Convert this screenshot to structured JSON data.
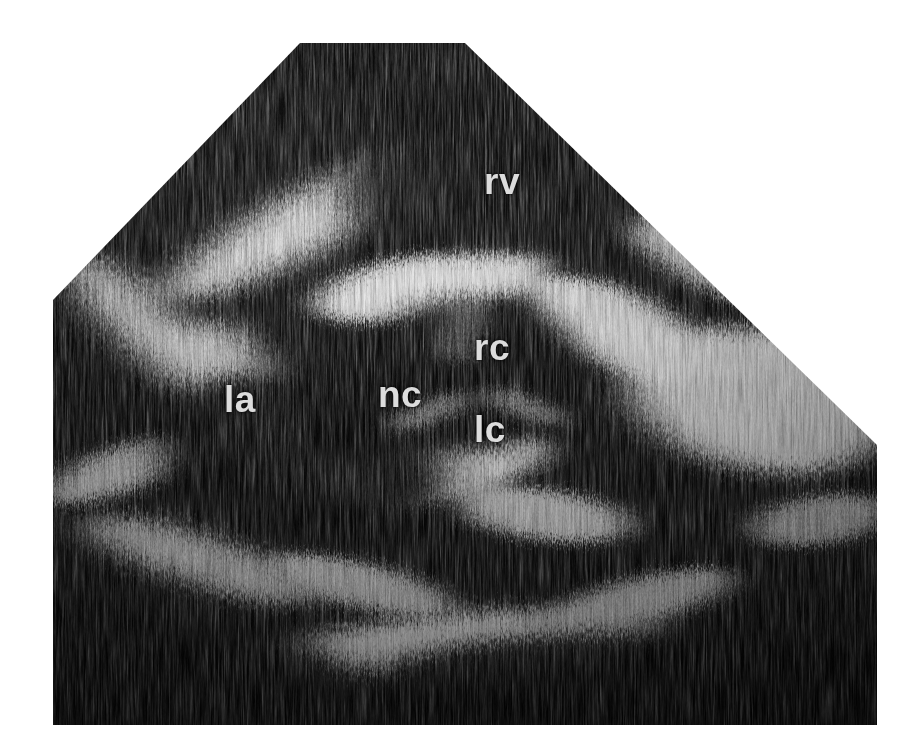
{
  "image": {
    "modality": "echocardiogram",
    "view": "parasternal short-axis at aortic valve level",
    "background_color": "#ffffff",
    "tissue_dark_color": "#0c0c0c",
    "tissue_bright_color": "#f2f2f2",
    "label_color": "#dcdcdc",
    "width": 913,
    "height": 749
  },
  "sector": {
    "shape": "truncated-sector",
    "vertices": "300,43 465,43 877,445 877,725 53,725 53,300",
    "apex_top_left_x": 300,
    "apex_top_right_x": 465,
    "apex_y": 43,
    "left_edge_x": 53,
    "right_edge_x": 877,
    "bottom_y": 725,
    "left_vertex_y": 300,
    "right_vertex_y": 445
  },
  "labels": [
    {
      "id": "rv",
      "text": "rv",
      "meaning": "right ventricle",
      "x": 484,
      "y": 163
    },
    {
      "id": "rc",
      "text": "rc",
      "meaning": "right coronary cusp",
      "x": 474,
      "y": 329
    },
    {
      "id": "nc",
      "text": "nc",
      "meaning": "non-coronary cusp",
      "x": 378,
      "y": 376
    },
    {
      "id": "lc",
      "text": "lc",
      "meaning": "left coronary cusp",
      "x": 474,
      "y": 411
    },
    {
      "id": "la",
      "text": "la",
      "meaning": "left atrium",
      "x": 224,
      "y": 381
    }
  ],
  "chart_data": {
    "type": "heatmap",
    "title": "",
    "xlabel": "",
    "ylabel": "",
    "bright_structures": [
      {
        "name": "anterior-rv-free-wall-band",
        "cx": 300,
        "cy": 225,
        "rx": 150,
        "ry": 30,
        "rot": -28,
        "intensity": 0.92
      },
      {
        "name": "aortic-root-anterior-wall",
        "cx": 430,
        "cy": 285,
        "rx": 120,
        "ry": 34,
        "rot": -10,
        "intensity": 0.95
      },
      {
        "name": "aortic-root-right-wall",
        "cx": 620,
        "cy": 330,
        "rx": 100,
        "ry": 40,
        "rot": 25,
        "intensity": 0.9
      },
      {
        "name": "aortic-root-left-wall",
        "cx": 250,
        "cy": 400,
        "rx": 90,
        "ry": 34,
        "rot": 60,
        "intensity": 0.88
      },
      {
        "name": "right-lateral-bright-field",
        "cx": 760,
        "cy": 400,
        "rx": 130,
        "ry": 70,
        "rot": 10,
        "intensity": 0.93
      },
      {
        "name": "valve-cusp-commissure",
        "cx": 440,
        "cy": 470,
        "rx": 110,
        "ry": 32,
        "rot": -12,
        "intensity": 0.9
      },
      {
        "name": "posterior-la-wall-band",
        "cx": 470,
        "cy": 645,
        "rx": 190,
        "ry": 34,
        "rot": -4,
        "intensity": 0.94
      },
      {
        "name": "left-lateral-band",
        "cx": 150,
        "cy": 330,
        "rx": 110,
        "ry": 28,
        "rot": 42,
        "intensity": 0.85
      },
      {
        "name": "inferior-left-band",
        "cx": 200,
        "cy": 560,
        "rx": 120,
        "ry": 26,
        "rot": 18,
        "intensity": 0.8
      },
      {
        "name": "mid-septal-echo",
        "cx": 545,
        "cy": 515,
        "rx": 85,
        "ry": 26,
        "rot": 8,
        "intensity": 0.82
      }
    ],
    "dark_chambers": [
      {
        "name": "right-ventricle-cavity",
        "cx": 520,
        "cy": 175,
        "rx": 180,
        "ry": 80,
        "rot": -6
      },
      {
        "name": "aortic-valve-lumen",
        "cx": 470,
        "cy": 375,
        "rx": 105,
        "ry": 80,
        "rot": 0
      },
      {
        "name": "left-atrium-cavity",
        "cx": 300,
        "cy": 455,
        "rx": 150,
        "ry": 80,
        "rot": 12
      },
      {
        "name": "far-field-shadow",
        "cx": 620,
        "cy": 690,
        "rx": 260,
        "ry": 60,
        "rot": 0
      }
    ]
  }
}
